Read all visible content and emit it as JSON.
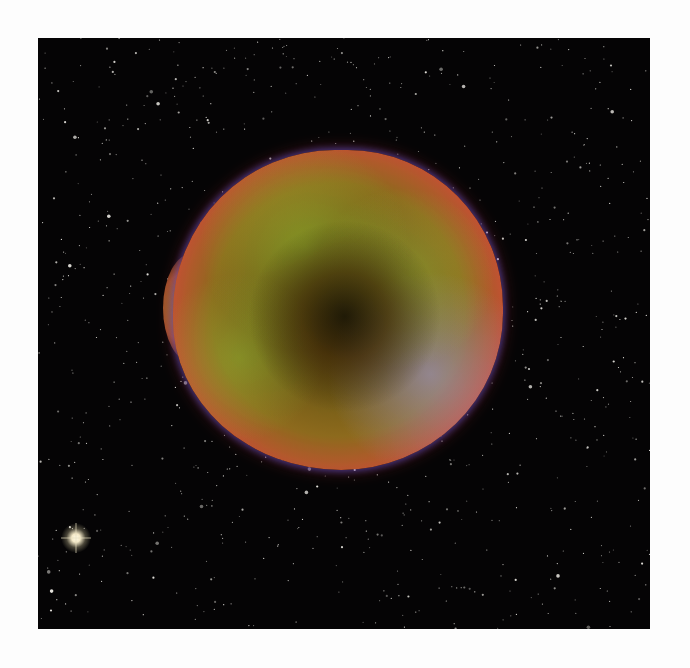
{
  "image": {
    "subject": "supernova remnant",
    "description": "Roughly circular supernova remnant glowing in red, green and blue, against a dense black star field",
    "colors": {
      "background": "#050405",
      "rim_red": "#d8503c",
      "interior_green": "#a0be46",
      "edge_blue": "#5a4aa0",
      "page": "#fdfdfd"
    }
  }
}
